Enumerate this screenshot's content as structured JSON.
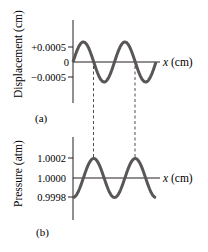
{
  "chart_data": [
    {
      "panel": "(a)",
      "type": "line",
      "title": "",
      "xlabel": "x (cm)",
      "ylabel": "Displacement (cm)",
      "yticks": [
        "+0.0005",
        "0",
        "−0.0005"
      ],
      "ytick_values": [
        0.0005,
        0,
        -0.0005
      ],
      "ylim": [
        -0.0007,
        0.0008
      ],
      "grid": false,
      "series": [
        {
          "name": "displacement",
          "shape": "sine",
          "amplitude": 0.0006,
          "phase": "starts at 0 rising",
          "cycles": 2.5
        }
      ]
    },
    {
      "panel": "(b)",
      "type": "line",
      "title": "",
      "xlabel": "x (cm)",
      "ylabel": "Pressure (atm)",
      "yticks": [
        "1.0002",
        "1.0000",
        "0.9998"
      ],
      "ytick_values": [
        1.0002,
        1.0,
        0.9998
      ],
      "ylim": [
        0.9996,
        1.0003
      ],
      "grid": false,
      "series": [
        {
          "name": "pressure",
          "shape": "sine",
          "amplitude": 0.0002,
          "phase": "starts at minimum",
          "cycles": 2.25
        }
      ],
      "annotations": [
        "dashed lines link displacement zero-crossings (decreasing) to pressure maxima"
      ]
    }
  ],
  "labels": {
    "a_ylabel": "Displacement (cm)",
    "a_xlabel": "x (cm)",
    "a_ticks": [
      "+0.0005",
      "0",
      "−0.0005"
    ],
    "a_panel": "(a)",
    "b_ylabel": "Pressure (atm)",
    "b_xlabel": "x (cm)",
    "b_ticks": [
      "1.0002",
      "1.0000",
      "0.9998"
    ],
    "b_panel": "(b)"
  },
  "colors": {
    "curve": "#5a5657",
    "axis": "#231f20",
    "dash": "#231f20"
  }
}
